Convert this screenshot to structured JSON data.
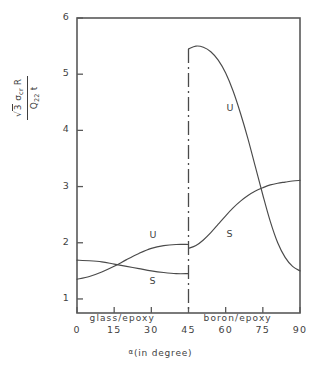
{
  "chart_data": {
    "type": "line",
    "title": "",
    "xlabel": "α (in degree)",
    "ylabel_numerator": "√3 σcr R",
    "ylabel_denominator": "Q22 t",
    "xlim": [
      0,
      90
    ],
    "ylim": [
      0.75,
      6
    ],
    "xticks": [
      0,
      15,
      30,
      45,
      60,
      75,
      90
    ],
    "yticks": [
      1,
      2,
      3,
      4,
      5,
      6
    ],
    "xtick_labels": [
      "0",
      "15",
      "30",
      "45",
      "60",
      "75",
      "90"
    ],
    "ytick_labels": [
      "1",
      "2",
      "3",
      "4",
      "5",
      "6"
    ],
    "grid": false,
    "legend": "inline-curve-labels",
    "divider_x": 45,
    "divider_style": "dash-dot",
    "regions": [
      {
        "name": "glass/epoxy",
        "x_range": [
          0,
          45
        ],
        "label_x": 18,
        "label_y": 1.0
      },
      {
        "name": "boron/epoxy",
        "x_range": [
          45,
          90
        ],
        "label_x": 64,
        "label_y": 1.0
      }
    ],
    "series": [
      {
        "name": "U",
        "label": "U",
        "region": "glass/epoxy",
        "label_at": {
          "x": 30.5,
          "y": 2.12
        },
        "x": [
          0,
          5,
          10,
          15,
          20,
          25,
          30,
          35,
          40,
          45
        ],
        "y": [
          1.35,
          1.4,
          1.48,
          1.58,
          1.7,
          1.81,
          1.9,
          1.95,
          1.97,
          1.97
        ]
      },
      {
        "name": "S",
        "label": "S",
        "region": "glass/epoxy",
        "label_at": {
          "x": 30.5,
          "y": 1.3
        },
        "x": [
          0,
          5,
          10,
          15,
          20,
          25,
          30,
          35,
          40,
          45
        ],
        "y": [
          1.69,
          1.68,
          1.66,
          1.62,
          1.58,
          1.54,
          1.5,
          1.47,
          1.45,
          1.45
        ]
      },
      {
        "name": "U",
        "label": "U",
        "region": "boron/epoxy",
        "label_at": {
          "x": 61.5,
          "y": 4.38
        },
        "x": [
          45,
          48,
          51,
          54,
          57,
          60,
          63,
          66,
          69,
          72,
          75,
          78,
          81,
          84,
          87,
          90
        ],
        "y": [
          5.45,
          5.5,
          5.48,
          5.4,
          5.25,
          5.02,
          4.7,
          4.3,
          3.85,
          3.35,
          2.85,
          2.38,
          2.0,
          1.74,
          1.58,
          1.5
        ]
      },
      {
        "name": "S",
        "label": "S",
        "region": "boron/epoxy",
        "label_at": {
          "x": 61.5,
          "y": 2.13
        },
        "x": [
          45,
          48,
          51,
          54,
          57,
          60,
          63,
          66,
          69,
          72,
          75,
          78,
          81,
          84,
          87,
          90
        ],
        "y": [
          1.9,
          1.95,
          2.05,
          2.18,
          2.33,
          2.48,
          2.62,
          2.74,
          2.84,
          2.92,
          2.98,
          3.03,
          3.06,
          3.08,
          3.1,
          3.11
        ]
      }
    ]
  },
  "axis": {
    "x_title_alpha": "α",
    "x_title_rest": "(in degree)"
  },
  "ylabel": {
    "sqrt_sign": "√",
    "num_three": "3",
    "num_sigma": "σ",
    "num_sigma_sub": "cr",
    "num_R": "R",
    "den_Q": "Q",
    "den_Q_sub": "22",
    "den_t": "t"
  }
}
